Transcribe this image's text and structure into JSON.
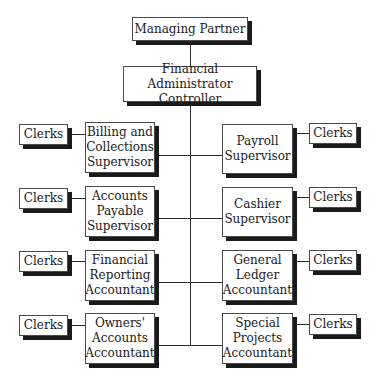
{
  "chart": {
    "top": {
      "managing_partner": "Managing Partner",
      "controller": "Financial Administrator\nController"
    },
    "left": [
      {
        "role": "Billing and\nCollections\nSupervisor",
        "clerks": "Clerks"
      },
      {
        "role": "Accounts\nPayable\nSupervisor",
        "clerks": "Clerks"
      },
      {
        "role": "Financial\nReporting\nAccountant",
        "clerks": "Clerks"
      },
      {
        "role": "Owners'\nAccounts\nAccountant",
        "clerks": "Clerks"
      }
    ],
    "right": [
      {
        "role": "Payroll\nSupervisor",
        "clerks": "Clerks"
      },
      {
        "role": "Cashier\nSupervisor",
        "clerks": "Clerks"
      },
      {
        "role": "General\nLedger\nAccountant",
        "clerks": "Clerks"
      },
      {
        "role": "Special\nProjects\nAccountant",
        "clerks": "Clerks"
      }
    ]
  }
}
